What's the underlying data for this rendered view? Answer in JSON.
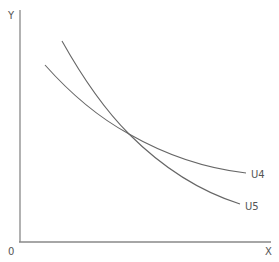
{
  "diagram": {
    "axis_labels": {
      "y": "Y",
      "x": "X",
      "origin": "0"
    },
    "curves": [
      {
        "name": "U4",
        "label": "U4"
      },
      {
        "name": "U5",
        "label": "U5"
      }
    ],
    "colors": {
      "axis": "#777777",
      "curve": "#666666",
      "text": "#555555"
    }
  }
}
